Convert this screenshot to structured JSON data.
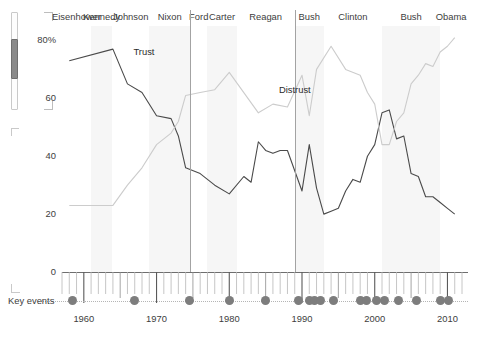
{
  "scrollbar": {
    "name": "vertical-scrollbar"
  },
  "chart_data": {
    "type": "line",
    "title": "",
    "xlabel": "",
    "ylabel": "",
    "ylim": [
      0,
      85
    ],
    "yticks": [
      0,
      20,
      40,
      60,
      80
    ],
    "ytick_labels": [
      "0",
      "20",
      "40",
      "60",
      "80%"
    ],
    "xlim": [
      1957,
      2012
    ],
    "xticks": [
      1960,
      1970,
      1980,
      1990,
      2000,
      2010
    ],
    "xtick_labels": [
      "1960",
      "1970",
      "1980",
      "1990",
      "2000",
      "2010"
    ],
    "grid": false,
    "legend_position": "inline-annotations",
    "colors": {
      "trust": "#4a4a4a",
      "distrust": "#cccccc",
      "band": "#f6f6f6",
      "divider": "#a3a3a3",
      "event_dot": "#7d7d7d"
    },
    "series": [
      {
        "name": "Trust",
        "color": "#4a4a4a",
        "points": [
          [
            1958,
            73
          ],
          [
            1964,
            77
          ],
          [
            1966,
            65
          ],
          [
            1968,
            62
          ],
          [
            1970,
            54
          ],
          [
            1972,
            53
          ],
          [
            1973,
            47
          ],
          [
            1974,
            36
          ],
          [
            1976,
            34
          ],
          [
            1978,
            30
          ],
          [
            1980,
            27
          ],
          [
            1982,
            33
          ],
          [
            1983,
            31
          ],
          [
            1984,
            45
          ],
          [
            1985,
            42
          ],
          [
            1986,
            41
          ],
          [
            1987,
            42
          ],
          [
            1988,
            42
          ],
          [
            1990,
            28
          ],
          [
            1991,
            44
          ],
          [
            1992,
            29
          ],
          [
            1993,
            20
          ],
          [
            1994,
            21
          ],
          [
            1995,
            22
          ],
          [
            1996,
            28
          ],
          [
            1997,
            32
          ],
          [
            1998,
            31
          ],
          [
            1999,
            40
          ],
          [
            2000,
            44
          ],
          [
            2001,
            55
          ],
          [
            2002,
            56
          ],
          [
            2003,
            46
          ],
          [
            2004,
            47
          ],
          [
            2005,
            34
          ],
          [
            2006,
            33
          ],
          [
            2007,
            26
          ],
          [
            2008,
            26
          ],
          [
            2009,
            24
          ],
          [
            2010,
            22
          ],
          [
            2011,
            20
          ]
        ]
      },
      {
        "name": "Distrust",
        "color": "#cccccc",
        "points": [
          [
            1958,
            23
          ],
          [
            1964,
            23
          ],
          [
            1966,
            30
          ],
          [
            1968,
            36
          ],
          [
            1970,
            44
          ],
          [
            1972,
            48
          ],
          [
            1973,
            52
          ],
          [
            1974,
            61
          ],
          [
            1976,
            62
          ],
          [
            1978,
            63
          ],
          [
            1980,
            69
          ],
          [
            1982,
            62
          ],
          [
            1984,
            55
          ],
          [
            1986,
            58
          ],
          [
            1988,
            57
          ],
          [
            1990,
            68
          ],
          [
            1991,
            54
          ],
          [
            1992,
            70
          ],
          [
            1994,
            78
          ],
          [
            1996,
            70
          ],
          [
            1998,
            68
          ],
          [
            1999,
            62
          ],
          [
            2000,
            58
          ],
          [
            2001,
            44
          ],
          [
            2002,
            44
          ],
          [
            2003,
            52
          ],
          [
            2004,
            55
          ],
          [
            2005,
            65
          ],
          [
            2006,
            68
          ],
          [
            2007,
            72
          ],
          [
            2008,
            71
          ],
          [
            2009,
            76
          ],
          [
            2010,
            78
          ],
          [
            2011,
            81
          ]
        ]
      }
    ],
    "series_annotations": [
      {
        "label": "Trust",
        "x": 1966,
        "y": 76
      },
      {
        "label": "Distrust",
        "x": 1986,
        "y": 63
      }
    ],
    "presidents": [
      {
        "label": "Eisenhower",
        "start": 1957,
        "end": 1961,
        "divider": false
      },
      {
        "label": "Kennedy",
        "start": 1961,
        "end": 1963.9,
        "divider": false
      },
      {
        "label": "Johnson",
        "start": 1963.9,
        "end": 1969,
        "divider": false
      },
      {
        "label": "Nixon",
        "start": 1969,
        "end": 1974.6,
        "divider": false
      },
      {
        "label": "Ford",
        "start": 1974.6,
        "end": 1977,
        "divider": true
      },
      {
        "label": "Carter",
        "start": 1977,
        "end": 1981,
        "divider": false
      },
      {
        "label": "Reagan",
        "start": 1981,
        "end": 1989,
        "divider": false
      },
      {
        "label": "Bush",
        "start": 1989,
        "end": 1993,
        "divider": true
      },
      {
        "label": "Clinton",
        "start": 1993,
        "end": 2001,
        "divider": false
      },
      {
        "label": "Bush",
        "start": 2001,
        "end": 2009,
        "divider": false
      },
      {
        "label": "Obama",
        "start": 2009,
        "end": 2012,
        "divider": false
      }
    ],
    "key_events_label": "Key events",
    "key_events_years": [
      1958.5,
      1967.0,
      1974.5,
      1980.0,
      1985.0,
      1989.5,
      1991.0,
      1991.7,
      1992.6,
      1994.3,
      1998.0,
      1998.8,
      2000.2,
      2001.3,
      2003.2,
      2005.8,
      2009.0,
      2010.2
    ]
  }
}
